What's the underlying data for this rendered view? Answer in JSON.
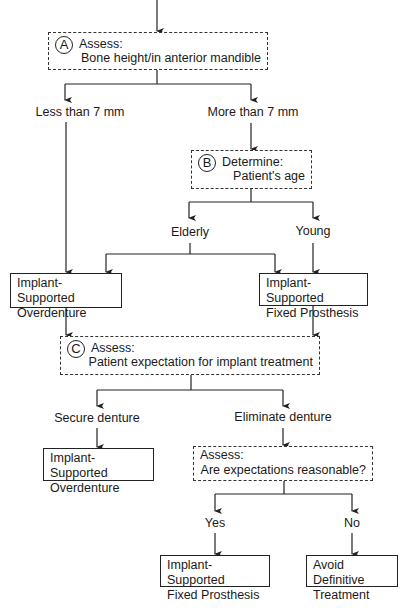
{
  "diagram": {
    "type": "decision-flowchart",
    "nodes": {
      "a": {
        "marker": "A",
        "heading": "Assess:",
        "detail": "Bone height/in anterior mandible"
      },
      "b": {
        "marker": "B",
        "heading": "Determine:",
        "detail": "Patient's age"
      },
      "c": {
        "marker": "C",
        "heading": "Assess:",
        "detail": "Patient expectation for implant treatment"
      },
      "d": {
        "heading": "Assess:",
        "detail": "Are expectations reasonable?"
      },
      "overdenture_1": {
        "line1": "Implant-Supported",
        "line2": "Overdenture"
      },
      "fixed_1": {
        "line1": "Implant-Supported",
        "line2": "Fixed Prosthesis"
      },
      "overdenture_2": {
        "line1": "Implant-Supported",
        "line2": "Overdenture"
      },
      "fixed_2": {
        "line1": "Implant-Supported",
        "line2": "Fixed Prosthesis"
      },
      "avoid": {
        "line1": "Avoid Definitive",
        "line2": "Treatment"
      }
    },
    "branch_labels": {
      "less_than_7": "Less than 7 mm",
      "more_than_7": "More than 7 mm",
      "elderly": "Elderly",
      "young": "Young",
      "secure": "Secure denture",
      "eliminate": "Eliminate denture",
      "yes": "Yes",
      "no": "No"
    },
    "edges": [
      [
        "start",
        "a"
      ],
      [
        "a",
        "less_than_7"
      ],
      [
        "a",
        "more_than_7"
      ],
      [
        "less_than_7",
        "overdenture_1"
      ],
      [
        "more_than_7",
        "b"
      ],
      [
        "b",
        "elderly"
      ],
      [
        "b",
        "young"
      ],
      [
        "elderly",
        "overdenture_1"
      ],
      [
        "elderly",
        "fixed_1"
      ],
      [
        "young",
        "fixed_1"
      ],
      [
        "overdenture_1",
        "c"
      ],
      [
        "fixed_1",
        "c"
      ],
      [
        "c",
        "secure"
      ],
      [
        "c",
        "eliminate"
      ],
      [
        "secure",
        "overdenture_2"
      ],
      [
        "eliminate",
        "d"
      ],
      [
        "d",
        "yes"
      ],
      [
        "d",
        "no"
      ],
      [
        "yes",
        "fixed_2"
      ],
      [
        "no",
        "avoid"
      ]
    ]
  },
  "colors": {
    "line": "#222222",
    "background": "#ffffff"
  }
}
